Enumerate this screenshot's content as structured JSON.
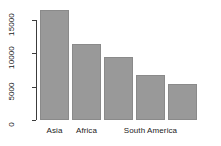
{
  "chart_data": {
    "type": "bar",
    "title": "",
    "subtitle": "",
    "xlabel": "",
    "ylabel": "",
    "categories": [
      "Asia",
      "Africa",
      "",
      "South America",
      ""
    ],
    "visible_category_labels": [
      "Asia",
      "Africa",
      "South America"
    ],
    "values": [
      16500,
      11400,
      9450,
      6750,
      5400
    ],
    "ylim": [
      0,
      16800
    ],
    "yticks": [
      0,
      5000,
      10000,
      15000
    ],
    "ytick_labels": [
      "0",
      "5000",
      "10000",
      "15000"
    ],
    "grid": false,
    "legend": null,
    "bar_fill_color": "#999999",
    "bar_border_color": "#8a8a8a",
    "axis_color": "#3c3c3c",
    "background_color": "#ffffff",
    "ytick_label_rotation": "90"
  },
  "axis": {
    "y_ticks": [
      {
        "label": "0",
        "value": 0
      },
      {
        "label": "5000",
        "value": 5000
      },
      {
        "label": "10000",
        "value": 10000
      },
      {
        "label": "15000",
        "value": 15000
      }
    ],
    "x_labels": [
      {
        "label": "Asia",
        "bar_index": 0
      },
      {
        "label": "Africa",
        "bar_index": 1
      },
      {
        "label": "South America",
        "bar_index": 3
      }
    ]
  },
  "bars": [
    {
      "label": "Asia",
      "value": 16500
    },
    {
      "label": "Africa",
      "value": 11400
    },
    {
      "label": "",
      "value": 9450
    },
    {
      "label": "South America",
      "value": 6750
    },
    {
      "label": "",
      "value": 5400
    }
  ]
}
